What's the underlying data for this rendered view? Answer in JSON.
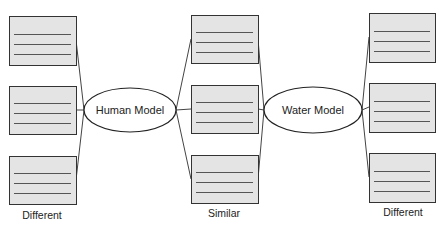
{
  "diagram": {
    "type": "double-bubble-map",
    "colors": {
      "box_fill": "#e4e4e4",
      "box_stroke": "#333333",
      "line_stroke": "#444444",
      "text_line_stroke": "#555555",
      "ellipse_fill": "#ffffff",
      "ellipse_stroke": "#222222",
      "text": "#222222"
    },
    "nodes": {
      "human": {
        "label": "Human Model",
        "cx": 130,
        "cy": 110,
        "rx": 46,
        "ry": 22
      },
      "water": {
        "label": "Water Model",
        "cx": 313,
        "cy": 110,
        "rx": 49,
        "ry": 23
      }
    },
    "columns": [
      {
        "id": "left",
        "caption": "Different",
        "caption_x": 42,
        "caption_y": 219,
        "x": 9,
        "w": 67,
        "boxes": [
          {
            "y": 16,
            "h": 49
          },
          {
            "y": 86,
            "h": 48
          },
          {
            "y": 156,
            "h": 48
          }
        ]
      },
      {
        "id": "middle",
        "caption": "Similar",
        "caption_x": 224,
        "caption_y": 217,
        "x": 191,
        "w": 67,
        "boxes": [
          {
            "y": 15,
            "h": 48
          },
          {
            "y": 85,
            "h": 48
          },
          {
            "y": 155,
            "h": 48
          }
        ]
      },
      {
        "id": "right",
        "caption": "Different",
        "caption_x": 403,
        "caption_y": 216,
        "x": 369,
        "w": 66,
        "boxes": [
          {
            "y": 13,
            "h": 49
          },
          {
            "y": 83,
            "h": 49
          },
          {
            "y": 153,
            "h": 49
          }
        ]
      }
    ],
    "connections": [
      {
        "from": [
          76,
          40
        ],
        "to": [
          84,
          110
        ]
      },
      {
        "from": [
          76,
          110
        ],
        "to": [
          84,
          110
        ]
      },
      {
        "from": [
          76,
          180
        ],
        "to": [
          84,
          110
        ]
      },
      {
        "from": [
          176,
          110
        ],
        "to": [
          191,
          39
        ]
      },
      {
        "from": [
          176,
          110
        ],
        "to": [
          191,
          109
        ]
      },
      {
        "from": [
          176,
          110
        ],
        "to": [
          191,
          179
        ]
      },
      {
        "from": [
          258,
          39
        ],
        "to": [
          264,
          110
        ]
      },
      {
        "from": [
          258,
          109
        ],
        "to": [
          264,
          110
        ]
      },
      {
        "from": [
          258,
          179
        ],
        "to": [
          264,
          110
        ]
      },
      {
        "from": [
          362,
          110
        ],
        "to": [
          369,
          37
        ]
      },
      {
        "from": [
          362,
          110
        ],
        "to": [
          369,
          107
        ]
      },
      {
        "from": [
          362,
          110
        ],
        "to": [
          369,
          177
        ]
      }
    ]
  }
}
